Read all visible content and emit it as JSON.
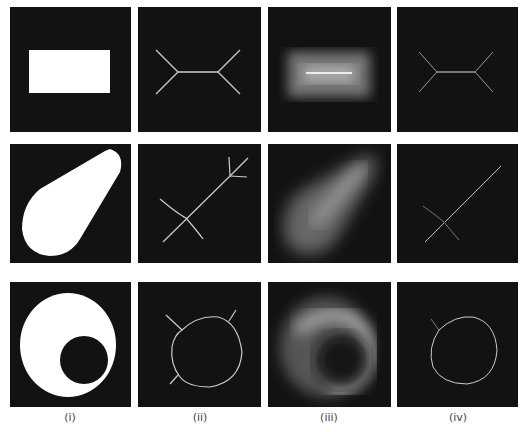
{
  "figure": {
    "columns": [
      {
        "label": "(i)",
        "meaning": "binary shape"
      },
      {
        "label": "(ii)",
        "meaning": "skeleton"
      },
      {
        "label": "(iii)",
        "meaning": "distance transform"
      },
      {
        "label": "(iv)",
        "meaning": "skeleton from distance map"
      }
    ],
    "rows": [
      {
        "shape": "rectangle"
      },
      {
        "shape": "teardrop"
      },
      {
        "shape": "disk with hole"
      }
    ],
    "colors": {
      "background": "#121212",
      "foreground": "#ffffff",
      "page": "#ffffff"
    }
  }
}
